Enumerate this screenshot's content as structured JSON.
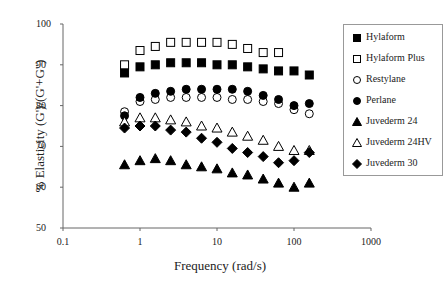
{
  "chart_data": {
    "type": "scatter",
    "title": "",
    "xlabel": "Frequency (rad/s)",
    "ylabel": "% Elasticity (G')/(G'+G\")",
    "xscale": "log",
    "xlim": [
      0.1,
      1000
    ],
    "ylim": [
      50,
      100
    ],
    "xticks": [
      "0.1",
      "1",
      "10",
      "100",
      "1000"
    ],
    "yticks": [
      "50",
      "60",
      "70",
      "80",
      "90",
      "100"
    ],
    "x": [
      0.63,
      1.0,
      1.58,
      2.5,
      3.98,
      6.3,
      10,
      15.8,
      25,
      39.8,
      63,
      100,
      158
    ],
    "series": [
      {
        "name": "Hylaform",
        "marker": "filled-square",
        "values": [
          88,
          89.5,
          90,
          90.5,
          90.5,
          90.5,
          90,
          90,
          89.5,
          89,
          88.5,
          88.5,
          87.5
        ]
      },
      {
        "name": "Hylaform Plus",
        "marker": "open-square",
        "values": [
          90,
          93.5,
          94.5,
          95.5,
          95.5,
          95.5,
          95.5,
          95,
          94,
          93,
          93,
          null,
          null
        ]
      },
      {
        "name": "Restylane",
        "marker": "open-circle",
        "values": [
          78.5,
          81,
          81.5,
          82,
          82,
          82,
          82,
          81.5,
          81.5,
          81,
          80.5,
          79,
          78
        ]
      },
      {
        "name": "Perlane",
        "marker": "filled-circle",
        "values": [
          77.5,
          82,
          83,
          83.5,
          84,
          84,
          84,
          84,
          83.5,
          82.5,
          81.5,
          80,
          80.5
        ]
      },
      {
        "name": "Juvederm 24",
        "marker": "filled-triangle",
        "values": [
          65.5,
          66.5,
          67,
          66.5,
          65.5,
          65,
          64.5,
          63.5,
          63,
          62,
          61,
          60,
          61
        ]
      },
      {
        "name": "Juvederm 24HV",
        "marker": "open-triangle",
        "values": [
          76,
          77,
          77,
          76.5,
          76,
          75,
          74.5,
          73.5,
          72.5,
          71.5,
          70,
          69,
          69
        ]
      },
      {
        "name": "Juvederm 30",
        "marker": "filled-diamond",
        "values": [
          74.5,
          75,
          75,
          74,
          73.5,
          72,
          71,
          69.5,
          68.5,
          67.5,
          66,
          66.5,
          68.5
        ]
      }
    ],
    "legend_position": "right",
    "grid": false
  },
  "axes": {
    "xlabel": "Frequency (rad/s)",
    "ylabel": "% Elasticity (G')/(G'+G\")",
    "xticks": [
      "0.1",
      "1",
      "10",
      "100",
      "1000"
    ],
    "yticks": [
      "100",
      "90",
      "80",
      "70",
      "60",
      "50"
    ]
  },
  "legend": [
    "Hylaform",
    "Hylaform Plus",
    "Restylane",
    "Perlane",
    "Juvederm 24",
    "Juvederm 24HV",
    "Juvederm 30"
  ]
}
